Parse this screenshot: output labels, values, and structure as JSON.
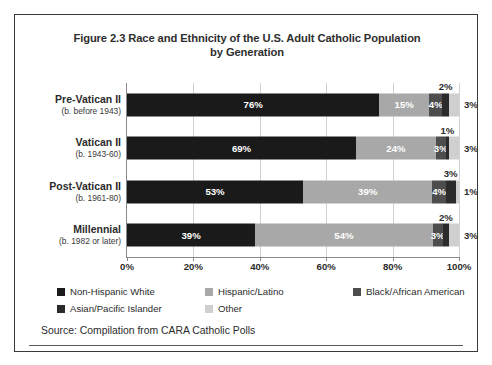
{
  "figure": {
    "title": "Figure 2.3 Race and Ethnicity of the U.S. Adult Catholic Population by Generation",
    "title_line1": "Figure 2.3 Race and Ethnicity of the U.S. Adult Catholic Population",
    "title_line2": "by Generation",
    "source": "Source: Compilation from CARA Catholic Polls"
  },
  "colors": {
    "non_hispanic_white": "#1a1a1a",
    "hispanic_latino": "#a8a8a8",
    "black_african_american": "#4d4d4d",
    "asian_pacific_islander": "#2b2b2b",
    "other": "#cfcfcf",
    "axis": "#8a8a8a",
    "grid": "#d2d2d2",
    "frame": "#3a3a3a",
    "text": "#2b2b2b"
  },
  "chart_data": {
    "type": "bar",
    "orientation": "horizontal",
    "stacked": true,
    "title": "Figure 2.3 Race and Ethnicity of the U.S. Adult Catholic Population by Generation",
    "xlabel": "",
    "ylabel": "",
    "xlim": [
      0,
      100
    ],
    "xticks": [
      0,
      20,
      40,
      60,
      80,
      100
    ],
    "xtick_labels": [
      "0%",
      "20%",
      "40%",
      "60%",
      "80%",
      "100%"
    ],
    "grid": true,
    "legend_position": "bottom",
    "units": "percent",
    "categories": [
      {
        "name": "Pre-Vatican II",
        "sub": "(b. before 1943)"
      },
      {
        "name": "Vatican II",
        "sub": "(b. 1943-60)"
      },
      {
        "name": "Post-Vatican II",
        "sub": "(b. 1961-80)"
      },
      {
        "name": "Millennial",
        "sub": "(b. 1982 or later)"
      }
    ],
    "series": [
      {
        "name": "Non-Hispanic White",
        "color": "#1a1a1a",
        "values": [
          76,
          69,
          53,
          39
        ]
      },
      {
        "name": "Hispanic/Latino",
        "color": "#a8a8a8",
        "values": [
          15,
          24,
          39,
          54
        ]
      },
      {
        "name": "Black/African American",
        "color": "#4d4d4d",
        "values": [
          4,
          3,
          4,
          3
        ]
      },
      {
        "name": "Asian/Pacific Islander",
        "color": "#2b2b2b",
        "values": [
          2,
          1,
          3,
          2
        ]
      },
      {
        "name": "Other",
        "color": "#cfcfcf",
        "values": [
          3,
          3,
          1,
          3
        ]
      }
    ],
    "bars": [
      {
        "category": "Pre-Vatican II",
        "segments": [
          {
            "series": "Non-Hispanic White",
            "value": 76,
            "label": "76%",
            "label_style": "inside"
          },
          {
            "series": "Hispanic/Latino",
            "value": 15,
            "label": "15%",
            "label_style": "inside"
          },
          {
            "series": "Black/African American",
            "value": 4,
            "label": "4%",
            "label_style": "inside"
          },
          {
            "series": "Asian/Pacific Islander",
            "value": 2,
            "label": "2%",
            "label_style": "callout"
          },
          {
            "series": "Other",
            "value": 3,
            "label": "3%",
            "label_style": "outside"
          }
        ]
      },
      {
        "category": "Vatican II",
        "segments": [
          {
            "series": "Non-Hispanic White",
            "value": 69,
            "label": "69%",
            "label_style": "inside"
          },
          {
            "series": "Hispanic/Latino",
            "value": 24,
            "label": "24%",
            "label_style": "inside"
          },
          {
            "series": "Black/African American",
            "value": 3,
            "label": "3%",
            "label_style": "inside"
          },
          {
            "series": "Asian/Pacific Islander",
            "value": 1,
            "label": "1%",
            "label_style": "callout"
          },
          {
            "series": "Other",
            "value": 3,
            "label": "3%",
            "label_style": "outside"
          }
        ]
      },
      {
        "category": "Post-Vatican II",
        "segments": [
          {
            "series": "Non-Hispanic White",
            "value": 53,
            "label": "53%",
            "label_style": "inside"
          },
          {
            "series": "Hispanic/Latino",
            "value": 39,
            "label": "39%",
            "label_style": "inside"
          },
          {
            "series": "Black/African American",
            "value": 4,
            "label": "4%",
            "label_style": "inside"
          },
          {
            "series": "Asian/Pacific Islander",
            "value": 3,
            "label": "3%",
            "label_style": "callout"
          },
          {
            "series": "Other",
            "value": 1,
            "label": "1%",
            "label_style": "outside"
          }
        ]
      },
      {
        "category": "Millennial",
        "segments": [
          {
            "series": "Non-Hispanic White",
            "value": 39,
            "label": "39%",
            "label_style": "inside"
          },
          {
            "series": "Hispanic/Latino",
            "value": 54,
            "label": "54%",
            "label_style": "inside"
          },
          {
            "series": "Black/African American",
            "value": 3,
            "label": "3%",
            "label_style": "inside"
          },
          {
            "series": "Asian/Pacific Islander",
            "value": 2,
            "label": "2%",
            "label_style": "callout"
          },
          {
            "series": "Other",
            "value": 3,
            "label": "3%",
            "label_style": "outside"
          }
        ]
      }
    ],
    "legend": [
      {
        "label": "Non-Hispanic White",
        "color": "#1a1a1a"
      },
      {
        "label": "Hispanic/Latino",
        "color": "#a8a8a8"
      },
      {
        "label": "Black/African American",
        "color": "#4d4d4d"
      },
      {
        "label": "Asian/Pacific Islander",
        "color": "#2b2b2b"
      },
      {
        "label": "Other",
        "color": "#cfcfcf"
      }
    ]
  }
}
